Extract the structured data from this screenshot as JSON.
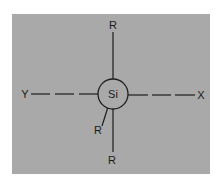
{
  "diagram": {
    "background_color": "#a9a9a9",
    "stroke_color": "#1e1e1e",
    "center_atom": {
      "label": "Si",
      "cx": 113,
      "cy": 94,
      "r": 15
    },
    "labels": {
      "top": "R",
      "bottom": "R",
      "diagonal": "R",
      "left": "Y",
      "right": "X"
    }
  }
}
